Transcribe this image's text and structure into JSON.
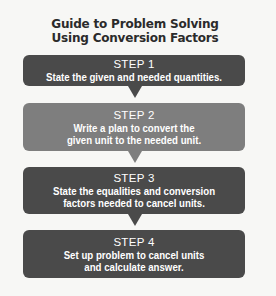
{
  "title": {
    "line1": "Guide to Problem Solving",
    "line2": "Using Conversion Factors"
  },
  "steps": [
    {
      "label": "STEP 1",
      "lines": [
        "State the given and needed quantities."
      ],
      "color": "#4a4a4a"
    },
    {
      "label": "STEP 2",
      "lines": [
        "Write a plan to convert the",
        "given unit to the needed unit."
      ],
      "color": "#7e7e7e"
    },
    {
      "label": "STEP 3",
      "lines": [
        "State the equalities and conversion",
        "factors needed to cancel units."
      ],
      "color": "#4a4a4a"
    },
    {
      "label": "STEP 4",
      "lines": [
        "Set up problem to cancel units",
        "and calculate answer."
      ],
      "color": "#4a4a4a"
    }
  ],
  "colors": {
    "background": "#f7f7f5",
    "title_text": "#2b2b2b",
    "step_text": "#ffffff"
  }
}
